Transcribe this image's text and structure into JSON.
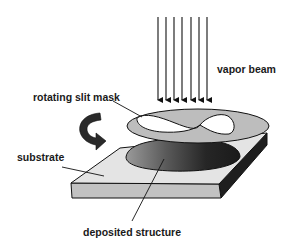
{
  "diagram": {
    "type": "schematic",
    "title": "",
    "labels": {
      "vapor_beam": "vapor beam",
      "rotating_slit_mask": "rotating slit mask",
      "substrate": "substrate",
      "deposited_structure": "deposited structure"
    },
    "components": [
      {
        "id": "vapor-beam",
        "kind": "arrow-array",
        "count": 7,
        "direction": "down"
      },
      {
        "id": "rotating-slit-mask",
        "kind": "disk-with-figure-eight-slit"
      },
      {
        "id": "rotation-arrow",
        "kind": "curved-arrow"
      },
      {
        "id": "deposited-structure",
        "kind": "dome"
      },
      {
        "id": "substrate",
        "kind": "slab"
      }
    ],
    "colors": {
      "mask": "#bdbdbd",
      "slab_top": "#e4e4e4",
      "slab_front": "#c2c2c2",
      "slab_side": "#1e1e1e",
      "deposit_dark": "#222222",
      "deposit_light": "#8a8a8a",
      "rotation_arrow": "#2a2a2a",
      "line": "#111111"
    }
  }
}
